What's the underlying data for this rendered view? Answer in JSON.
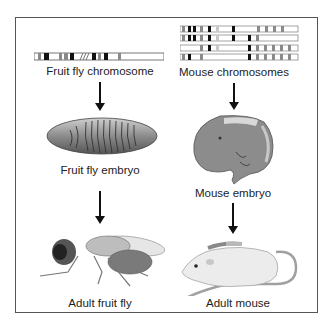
{
  "figure": {
    "left_column": {
      "chromosome_label": "Fruit fly chromosome",
      "embryo_label": "Fruit fly embryo",
      "adult_label": "Adult fruit fly"
    },
    "right_column": {
      "chromosome_label": "Mouse chromosomes",
      "embryo_label": "Mouse embryo",
      "adult_label": "Adult mouse"
    },
    "colors": {
      "band_dark": "#111111",
      "band_gray": "#8a8a8a",
      "band_light": "#c8c8c8",
      "specimen_gray": "#8c8c8c",
      "mouse_white": "#ececec",
      "tail_gray": "#a0a0a0"
    }
  }
}
